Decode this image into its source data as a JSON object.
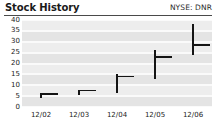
{
  "header": {
    "title": "Stock History",
    "ticker": "NYSE: DNR"
  },
  "chart_data": {
    "type": "bar",
    "subtype": "hlc-range",
    "title": "Stock History",
    "xlabel": "",
    "ylabel": "",
    "categories": [
      "12/02",
      "12/03",
      "12/04",
      "12/05",
      "12/06"
    ],
    "ylim": [
      0,
      40
    ],
    "yticks": [
      0,
      5,
      10,
      15,
      20,
      25,
      30,
      35,
      40
    ],
    "grid": true,
    "legend": false,
    "series": [
      {
        "name": "High",
        "values": [
          6,
          7.5,
          15,
          26,
          38
        ]
      },
      {
        "name": "Low",
        "values": [
          4,
          5.5,
          6.5,
          13,
          24
        ]
      },
      {
        "name": "Close",
        "values": [
          6,
          7.5,
          14,
          23,
          28.5
        ]
      }
    ],
    "points": [
      {
        "x": "12/02",
        "high": 6,
        "low": 4,
        "close": 6
      },
      {
        "x": "12/03",
        "high": 7.5,
        "low": 5.5,
        "close": 7.5
      },
      {
        "x": "12/04",
        "high": 15,
        "low": 6.5,
        "close": 14
      },
      {
        "x": "12/05",
        "high": 26,
        "low": 13,
        "close": 23
      },
      {
        "x": "12/06",
        "high": 38,
        "low": 24,
        "close": 28.5
      }
    ]
  },
  "colors": {
    "plot_background": "#e4e4e4",
    "band": "#ededed",
    "gridline": "#fafafa",
    "marker": "#151515",
    "rule": "#4a4a4a",
    "text": "#222222"
  }
}
